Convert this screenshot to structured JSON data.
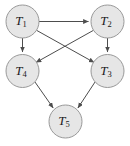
{
  "diagram": {
    "type": "directed-acyclic-graph",
    "title": "",
    "background_color": "#ffffff",
    "node_fill_color": "#e6e6e6",
    "node_stroke_color": "#999999",
    "edge_color": "#4d4d4d",
    "label_color": "#1a1a1a",
    "node_radius": 16.5,
    "nodes": [
      {
        "id": "T1",
        "base": "T",
        "subscript": "1",
        "label": "T1",
        "cx": 22.5,
        "cy": 21.5
      },
      {
        "id": "T2",
        "base": "T",
        "subscript": "2",
        "label": "T2",
        "cx": 107.5,
        "cy": 21.5
      },
      {
        "id": "T4",
        "base": "T",
        "subscript": "4",
        "label": "T4",
        "cx": 22.5,
        "cy": 71.0
      },
      {
        "id": "T3",
        "base": "T",
        "subscript": "3",
        "label": "T3",
        "cx": 107.5,
        "cy": 71.0
      },
      {
        "id": "T5",
        "base": "T",
        "subscript": "5",
        "label": "T5",
        "cx": 65.5,
        "cy": 121.5
      }
    ],
    "edges": [
      {
        "from": "T1",
        "to": "T2",
        "d": "M 39.0,21.5 L 88.5,21.5"
      },
      {
        "from": "T1",
        "to": "T4",
        "d": "M 22.5,38.0 L 22.5,52.0"
      },
      {
        "from": "T1",
        "to": "T3",
        "d": "M 36.5,30.3 L 94.2,62.5"
      },
      {
        "from": "T2",
        "to": "T3",
        "d": "M 107.5,38.0 L 107.5,52.0"
      },
      {
        "from": "T2",
        "to": "T4",
        "d": "M 93.5,30.3 L 35.9,62.5"
      },
      {
        "from": "T4",
        "to": "T5",
        "d": "M 34.9,81.9 L 53.2,108.0"
      },
      {
        "from": "T3",
        "to": "T5",
        "d": "M 95.1,81.9 L 77.9,108.0"
      }
    ]
  }
}
